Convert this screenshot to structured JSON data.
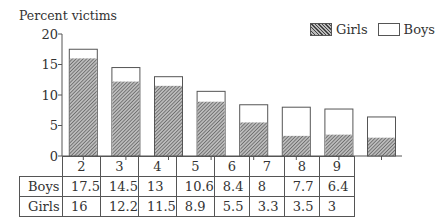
{
  "chart_data": {
    "type": "bar",
    "stacked": true,
    "title": "",
    "ylabel": "Percent victims",
    "xlabel": "",
    "ylim": [
      0,
      20
    ],
    "yticks": [
      0,
      5,
      10,
      15,
      20
    ],
    "categories": [
      "2",
      "3",
      "4",
      "5",
      "6",
      "7",
      "8",
      "9"
    ],
    "series": [
      {
        "name": "Boys",
        "values": [
          17.5,
          14.5,
          13,
          10.6,
          8.4,
          8,
          7.7,
          6.4
        ],
        "fill": "white"
      },
      {
        "name": "Girls",
        "values": [
          16,
          12.2,
          11.5,
          8.9,
          5.5,
          3.3,
          3.5,
          3
        ],
        "fill": "hatched"
      }
    ],
    "legend": {
      "position": "top-right",
      "entries": [
        "Girls",
        "Boys"
      ]
    },
    "grid": false,
    "table": {
      "rows": [
        {
          "label": "Boys",
          "values": [
            "17.5",
            "14.5",
            "13",
            "10.6",
            "8.4",
            "8",
            "7.7",
            "6.4"
          ]
        },
        {
          "label": "Girls",
          "values": [
            "16",
            "12.2",
            "11.5",
            "8.9",
            "5.5",
            "3.3",
            "3.5",
            "3"
          ]
        }
      ]
    }
  },
  "labels": {
    "ylabel": "Percent victims",
    "legend_girls": "Girls",
    "legend_boys": "Boys",
    "row_boys": "Boys",
    "row_girls": "Girls",
    "yticks": [
      "0",
      "5",
      "10",
      "15",
      "20"
    ],
    "categories": [
      "2",
      "3",
      "4",
      "5",
      "6",
      "7",
      "8",
      "9"
    ]
  }
}
